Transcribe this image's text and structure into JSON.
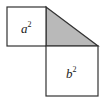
{
  "diagram": {
    "shapes": [
      {
        "id": "square-a",
        "label_base": "a",
        "label_exp": "2"
      },
      {
        "id": "triangle",
        "fill": "#b9b9b9"
      },
      {
        "id": "square-b",
        "label_base": "b",
        "label_exp": "2"
      }
    ],
    "colors": {
      "stroke": "#333333",
      "triangle_fill": "#b9b9b9",
      "background": "#ffffff"
    }
  }
}
